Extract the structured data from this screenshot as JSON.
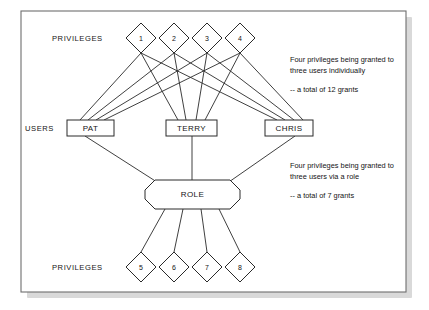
{
  "diagram": {
    "frame": {
      "border_color": "#6e6e6e",
      "background": "#ffffff"
    },
    "labels": {
      "privileges_top": "PRIVILEGES",
      "users": "USERS",
      "privileges_bottom": "PRIVILEGES"
    },
    "privileges_top": [
      {
        "id": "p1",
        "label": "1",
        "cx": 141,
        "cy": 38
      },
      {
        "id": "p2",
        "label": "2",
        "cx": 174,
        "cy": 38
      },
      {
        "id": "p3",
        "label": "3",
        "cx": 207,
        "cy": 38
      },
      {
        "id": "p4",
        "label": "4",
        "cx": 240,
        "cy": 38
      }
    ],
    "users": [
      {
        "id": "u1",
        "label": "PAT",
        "x": 67,
        "y": 120,
        "w": 47,
        "h": 16
      },
      {
        "id": "u2",
        "label": "TERRY",
        "x": 166,
        "y": 120,
        "w": 51,
        "h": 16
      },
      {
        "id": "u3",
        "label": "CHRIS",
        "x": 265,
        "y": 120,
        "w": 48,
        "h": 16
      }
    ],
    "role": {
      "id": "role",
      "label": "ROLE",
      "x": 145,
      "y": 180,
      "w": 95,
      "h": 29
    },
    "privileges_bottom": [
      {
        "id": "p5",
        "label": "5",
        "cx": 141,
        "cy": 267
      },
      {
        "id": "p6",
        "label": "6",
        "cx": 174,
        "cy": 267
      },
      {
        "id": "p7",
        "label": "7",
        "cx": 207,
        "cy": 267
      },
      {
        "id": "p8",
        "label": "8",
        "cx": 240,
        "cy": 267
      }
    ],
    "notes": [
      {
        "id": "note-individual",
        "lines": [
          "Four privileges being granted to",
          "three users individually"
        ],
        "total": "-- a total of 12 grants"
      },
      {
        "id": "note-role",
        "lines": [
          "Four privileges being granted to",
          "three users via a role"
        ],
        "total": "-- a total of 7 grants"
      }
    ]
  }
}
